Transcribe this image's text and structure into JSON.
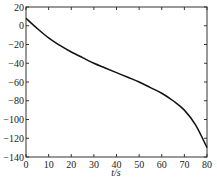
{
  "chart_data": {
    "type": "line",
    "title": "",
    "xlabel": "t/s",
    "ylabel": "",
    "xlim": [
      0,
      80
    ],
    "ylim": [
      -140,
      20
    ],
    "grid": false,
    "legend": null,
    "x_ticks": [
      0,
      10,
      20,
      30,
      40,
      50,
      60,
      70,
      80
    ],
    "y_ticks": [
      20,
      0,
      -20,
      -40,
      -60,
      -80,
      -100,
      -120,
      -140
    ],
    "x_tick_labels": [
      "0",
      "10",
      "20",
      "30",
      "40",
      "50",
      "60",
      "70",
      "80"
    ],
    "y_tick_labels": [
      "20",
      "0",
      "−20",
      "−40",
      "−60",
      "−80",
      "−100",
      "−120",
      "−140"
    ],
    "series": [
      {
        "name": "curve",
        "color": "#111111",
        "x": [
          0,
          5,
          10,
          15,
          20,
          25,
          30,
          35,
          40,
          45,
          50,
          55,
          60,
          65,
          70,
          75,
          80
        ],
        "y": [
          8,
          -3,
          -13,
          -21,
          -28,
          -34,
          -40,
          -45,
          -50,
          -55,
          -60,
          -66,
          -72,
          -80,
          -90,
          -106,
          -130
        ]
      }
    ]
  }
}
